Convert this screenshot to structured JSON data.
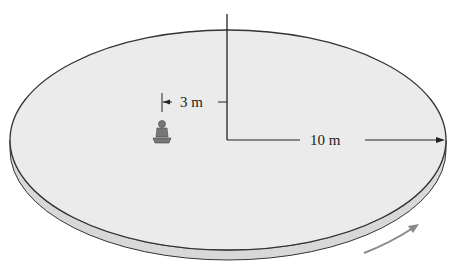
{
  "diagram": {
    "labels": {
      "inner_radius": "3 m",
      "outer_radius": "10 m"
    },
    "colors": {
      "platform_top": "#ebebeb",
      "platform_edge": "#d8d8d8",
      "outline": "#333333",
      "rotation_arrow": "#8a8a8a"
    },
    "rotation_direction": "counterclockwise (viewed from above)"
  }
}
